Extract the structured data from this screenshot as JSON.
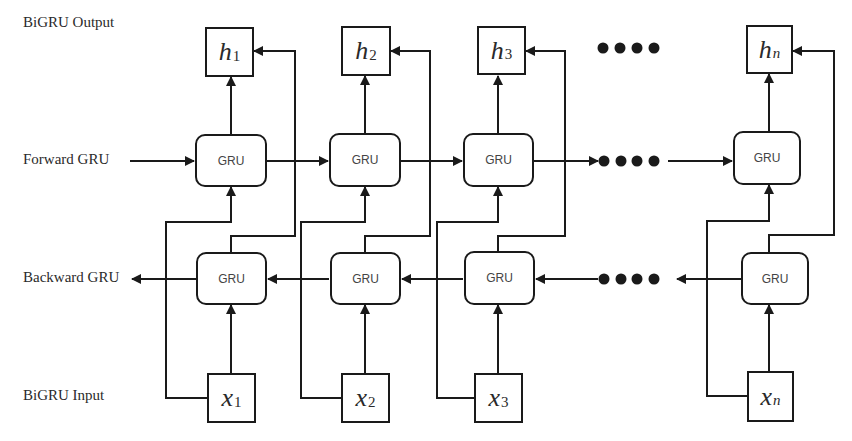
{
  "row_labels": {
    "output": "BiGRU Output",
    "forward": "Forward GRU",
    "backward": "Backward GRU",
    "input": "BiGRU Input"
  },
  "cell_label": "GRU",
  "outputs": [
    {
      "var": "h",
      "sub": "1"
    },
    {
      "var": "h",
      "sub": "2"
    },
    {
      "var": "h",
      "sub": "3"
    },
    {
      "var": "h",
      "sub": "n"
    }
  ],
  "inputs": [
    {
      "var": "x",
      "sub": "1"
    },
    {
      "var": "x",
      "sub": "2"
    },
    {
      "var": "x",
      "sub": "3"
    },
    {
      "var": "x",
      "sub": "n"
    }
  ],
  "ellipsis": "••••",
  "colors": {
    "stroke": "#1a1a1a",
    "text": "#2a2a2a",
    "cell_text": "#444444",
    "background": "#ffffff"
  }
}
